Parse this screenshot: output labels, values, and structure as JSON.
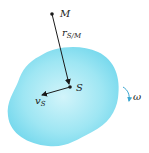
{
  "diagram": {
    "type": "rigid-body-kinematics",
    "points": {
      "M": {
        "label": "M",
        "x": 52,
        "y": 14
      },
      "S": {
        "label": "S",
        "x": 70,
        "y": 87
      }
    },
    "vectors": {
      "r": {
        "label_main": "r",
        "label_sub": "S/M",
        "from": "M",
        "to": "S"
      },
      "v": {
        "label_main": "v",
        "label_sub": "S",
        "from": "S",
        "to_x": 40,
        "to_y": 95
      }
    },
    "rotation": {
      "label": "ω",
      "direction": "clockwise"
    },
    "colors": {
      "body_fill": "#7fdcee",
      "body_fill_center": "#c9f1f8",
      "vector": "#1a1a1a",
      "omega_arrow": "#3aa6d0"
    }
  }
}
